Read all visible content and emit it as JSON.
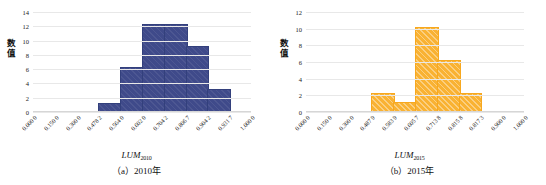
{
  "figure": {
    "panels": [
      {
        "id": "panel-a",
        "caption": "（a）2010年",
        "xlabel_main": "LUM",
        "xlabel_sub": "2010",
        "ylabel": "数值",
        "color": "#3f4a8a"
      },
      {
        "id": "panel-b",
        "caption": "（b）2015年",
        "xlabel_main": "LUM",
        "xlabel_sub": "2015",
        "ylabel": "数值",
        "color": "#f9b233"
      }
    ]
  },
  "chart_data": [
    {
      "type": "bar",
      "title": "（a）2010年",
      "xlabel": "LUM2010",
      "ylabel": "数值",
      "series_color": "#3f4a8a",
      "grid": true,
      "legend": "none",
      "ylim": [
        0,
        14
      ],
      "yticks": [
        0,
        2,
        4,
        6,
        8,
        10,
        12,
        14
      ],
      "xticklabels": [
        "0.000 0",
        "0.150 0",
        "0.300 0",
        "0.478 2",
        "0.564 0",
        "0.602 0",
        "0.704 2",
        "0.806 7",
        "0.904 2",
        "0.931 7",
        "1.000 0"
      ],
      "bin_edges_index": [
        3,
        4,
        5,
        6,
        7,
        8,
        9
      ],
      "categories": [
        "0.478 2–0.564 0",
        "0.564 0–0.602 0",
        "0.602 0–0.704 2",
        "0.704 2–0.806 7",
        "0.806 7–0.904 2",
        "0.904 2–0.931 7"
      ],
      "values": [
        1,
        6,
        12,
        12,
        9,
        3
      ]
    },
    {
      "type": "bar",
      "title": "（b）2015年",
      "xlabel": "LUM2015",
      "ylabel": "数值",
      "series_color": "#f9b233",
      "grid": true,
      "legend": "none",
      "ylim": [
        0,
        12
      ],
      "yticks": [
        0,
        2,
        4,
        6,
        8,
        10,
        12
      ],
      "xticklabels": [
        "0.000 0",
        "0.150 0",
        "0.300 0",
        "0.487 9",
        "0.583 9",
        "0.605 7",
        "0.713 8",
        "0.815 8",
        "0.817 3",
        "0.900 0",
        "1.000 0"
      ],
      "bin_edges_index": [
        3,
        4,
        5,
        6,
        7,
        8
      ],
      "categories": [
        "0.487 9–0.583 9",
        "0.583 9–0.605 7",
        "0.605 7–0.713 8",
        "0.713 8–0.815 8",
        "0.815 8–0.817 3"
      ],
      "values": [
        2,
        1,
        10,
        6,
        2
      ]
    }
  ]
}
